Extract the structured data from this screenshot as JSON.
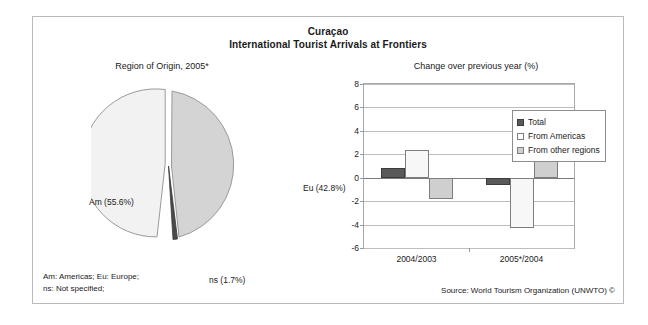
{
  "figure": {
    "title_line1": "Curaçao",
    "title_line2": "International Tourist Arrivals at Frontiers"
  },
  "footer": {
    "notes_line1": "Am: Americas; Eu: Europe;",
    "notes_line2": "ns: Not specified;",
    "source": "Source: World Tourism Organization (UNWTO) ©"
  },
  "colors": {
    "total": "#595959",
    "from_americas": "#f7f7f7",
    "from_other_regions": "#cfcfcf",
    "pie_am": "#f2f2f2",
    "pie_eu": "#d4d4d4",
    "pie_ns": "#4a4a4a",
    "frame": "#b9b9b9",
    "grid": "#bdbdbd"
  },
  "pie_labels": {
    "eu": "Eu (42.8%)",
    "am": "Am (55.6%)",
    "ns": "ns (1.7%)"
  },
  "axis": {
    "y_ticks": [
      "8",
      "6",
      "4",
      "2",
      "0",
      "-2",
      "-4",
      "-6"
    ],
    "x_ticks": [
      "2004/2003",
      "2005*/2004"
    ]
  },
  "legend": {
    "items": [
      {
        "label": "Total",
        "key": "total"
      },
      {
        "label": "From Americas",
        "key": "americas"
      },
      {
        "label": "From other regions",
        "key": "other"
      }
    ]
  },
  "chart_data": [
    {
      "type": "pie",
      "title": "Region of Origin, 2005*",
      "categories": [
        "Am (Americas)",
        "Eu (Europe)",
        "ns (Not specified)"
      ],
      "labels": [
        "Am (55.6%)",
        "Eu (42.8%)",
        "ns (1.7%)"
      ],
      "values": [
        55.6,
        42.8,
        1.7
      ],
      "unit": "%",
      "colors": [
        "#f2f2f2",
        "#d4d4d4",
        "#4a4a4a"
      ],
      "legend": "labels placed outside slices"
    },
    {
      "type": "bar",
      "title": "Change over previous year (%)",
      "categories": [
        "2004/2003",
        "2005*/2004"
      ],
      "series": [
        {
          "name": "Total",
          "values": [
            0.8,
            -0.6
          ]
        },
        {
          "name": "From Americas",
          "values": [
            2.4,
            -4.3
          ]
        },
        {
          "name": "From other regions",
          "values": [
            -1.8,
            5.7
          ]
        }
      ],
      "xlabel": "",
      "ylabel": "Change over previous year (%)",
      "ylim": [
        -6,
        8
      ],
      "ytick_step": 2,
      "grid": true,
      "legend_position": "top-right-inside"
    }
  ]
}
